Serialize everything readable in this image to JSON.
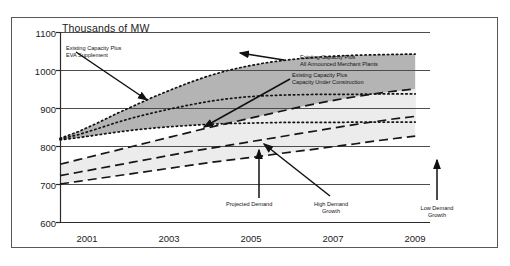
{
  "chart_data": {
    "type": "area",
    "title": "Thousands of MW",
    "xlabel": "",
    "ylabel": "Thousands of MW",
    "ylim": [
      600,
      1100
    ],
    "yticks": [
      1100,
      1000,
      900,
      800,
      700,
      600
    ],
    "xlim": [
      2000,
      2010
    ],
    "xticks": [
      2001,
      2003,
      2005,
      2007,
      2009
    ],
    "xtick_labels": [
      "2001",
      "2003",
      "2005",
      "2007",
      "2009"
    ],
    "grid": "horizontal",
    "legend_position": "inline-annotations",
    "x": [
      2000,
      2000.5,
      2001,
      2001.5,
      2002,
      2002.5,
      2003,
      2003.5,
      2004,
      2004.5,
      2005,
      2005.5,
      2006,
      2006.5,
      2007,
      2007.5,
      2008,
      2008.5,
      2009,
      2009.6
    ],
    "series": [
      {
        "name": "Existing Capacity Plus EVA Supplement",
        "style": "dotted",
        "values": [
          820,
          838,
          860,
          884,
          906,
          928,
          948,
          967,
          984,
          998,
          1009,
          1018,
          1025,
          1030,
          1034,
          1037,
          1039,
          1040,
          1041,
          1042
        ]
      },
      {
        "name": "Existing Capacity Plus All Announced Merchant Plants",
        "style": "dotted",
        "values": [
          818,
          830,
          845,
          861,
          875,
          887,
          898,
          908,
          917,
          924,
          929,
          932,
          934,
          935,
          936,
          936,
          936,
          937,
          937,
          937
        ]
      },
      {
        "name": "Existing Capacity Plus Capacity Under Construction",
        "style": "dotted",
        "values": [
          816,
          822,
          829,
          836,
          842,
          847,
          851,
          854,
          857,
          859,
          860,
          861,
          862,
          862,
          862,
          862,
          863,
          863,
          863,
          863
        ]
      },
      {
        "name": "High Demand Growth",
        "style": "dashed",
        "values": [
          752,
          764,
          776,
          788,
          800,
          812,
          824,
          836,
          848,
          859,
          870,
          881,
          892,
          903,
          913,
          922,
          930,
          937,
          944,
          950
        ]
      },
      {
        "name": "Projected Demand",
        "style": "dashed",
        "values": [
          722,
          731,
          740,
          749,
          758,
          767,
          776,
          785,
          793,
          801,
          809,
          817,
          825,
          833,
          841,
          849,
          857,
          864,
          871,
          878
        ]
      },
      {
        "name": "Low Demand Growth",
        "style": "dashed",
        "values": [
          700,
          707,
          714,
          721,
          728,
          735,
          742,
          749,
          756,
          762,
          768,
          774,
          781,
          787,
          793,
          800,
          806,
          813,
          819,
          826
        ]
      }
    ],
    "annotations": [
      {
        "id": "eva-supplement",
        "text_lines": [
          "Existing Capacity Plus",
          "EVA Supplement"
        ]
      },
      {
        "id": "all-announced-merchant-plants",
        "text_lines": [
          "Existing Capacity Plus",
          "All Announced Merchant Plants"
        ]
      },
      {
        "id": "capacity-under-construction",
        "text_lines": [
          "Existing Capacity Plus",
          "Capacity Under Construction"
        ]
      },
      {
        "id": "projected-demand",
        "text_lines": [
          "Projected Demand"
        ]
      },
      {
        "id": "high-demand-growth",
        "text_lines": [
          "High Demand",
          "Growth"
        ]
      },
      {
        "id": "low-demand-growth",
        "text_lines": [
          "Low Demand",
          "Growth"
        ]
      }
    ],
    "colors": {
      "upper_band_fill": "#b4b4b4",
      "lower_band_fill": "#ececec",
      "line": "#1c1c1c",
      "grid": "#4c4c4c",
      "frame": "#58585a",
      "text": "#1c1c1c"
    }
  },
  "yticks": {
    "t0": "1100",
    "t1": "1000",
    "t2": "900",
    "t3": "800",
    "t4": "700",
    "t5": "600"
  },
  "xticks": {
    "t0": "2001",
    "t1": "2003",
    "t2": "2005",
    "t3": "2007",
    "t4": "2009"
  },
  "labels": {
    "axis_title": "Thousands of MW",
    "eva_l1": "Existing Capacity Plus",
    "eva_l2": "EVA Supplement",
    "merchant_l1": "Existing Capacity Plus",
    "merchant_l2": "All Announced Merchant Plants",
    "construction_l1": "Existing Capacity Plus",
    "construction_l2": "Capacity Under Construction",
    "projected_demand": "Projected Demand",
    "high_demand_l1": "High Demand",
    "high_demand_l2": "Growth",
    "low_demand_l1": "Low Demand",
    "low_demand_l2": "Growth"
  }
}
